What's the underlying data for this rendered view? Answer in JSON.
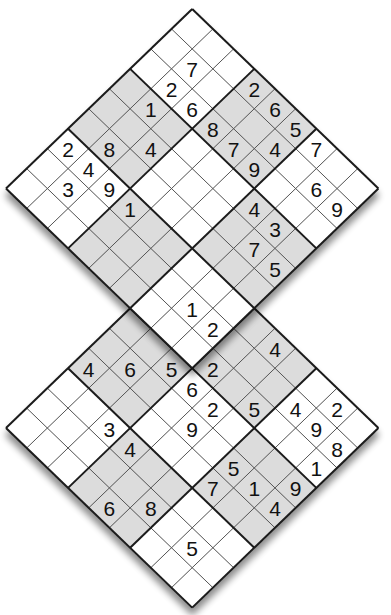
{
  "puzzle": {
    "type": "twin-diagonal-sudoku",
    "description": "Two overlapping 9x9 sudoku grids rotated 45 degrees, sharing one 3x3 box",
    "colors": {
      "shaded_box": "#dcdcdc",
      "white_box": "#ffffff",
      "thin_line": "#555555",
      "thick_line": "#1a1a1a",
      "digit": "#111111",
      "shadow": "#9a9a9a"
    },
    "grids": [
      {
        "id": "top-grid",
        "givens": [
          {
            "r": 0,
            "c": 3,
            "v": "2"
          },
          {
            "r": 0,
            "c": 4,
            "v": "6"
          },
          {
            "r": 0,
            "c": 5,
            "v": "5"
          },
          {
            "r": 0,
            "c": 6,
            "v": "7"
          },
          {
            "r": 1,
            "c": 1,
            "v": "7"
          },
          {
            "r": 1,
            "c": 5,
            "v": "4"
          },
          {
            "r": 1,
            "c": 7,
            "v": "6"
          },
          {
            "r": 1,
            "c": 8,
            "v": "9"
          },
          {
            "r": 2,
            "c": 1,
            "v": "2"
          },
          {
            "r": 2,
            "c": 2,
            "v": "6"
          },
          {
            "r": 2,
            "c": 3,
            "v": "8"
          },
          {
            "r": 2,
            "c": 4,
            "v": "7"
          },
          {
            "r": 2,
            "c": 5,
            "v": "9"
          },
          {
            "r": 3,
            "c": 1,
            "v": "1"
          },
          {
            "r": 3,
            "c": 6,
            "v": "4"
          },
          {
            "r": 3,
            "c": 7,
            "v": "3"
          },
          {
            "r": 4,
            "c": 2,
            "v": "4"
          },
          {
            "r": 4,
            "c": 7,
            "v": "7"
          },
          {
            "r": 4,
            "c": 8,
            "v": "5"
          },
          {
            "r": 5,
            "c": 1,
            "v": "8"
          },
          {
            "r": 6,
            "c": 0,
            "v": "2"
          },
          {
            "r": 6,
            "c": 1,
            "v": "4"
          },
          {
            "r": 6,
            "c": 2,
            "v": "9"
          },
          {
            "r": 6,
            "c": 3,
            "v": "1"
          },
          {
            "r": 7,
            "c": 1,
            "v": "3"
          },
          {
            "r": 7,
            "c": 7,
            "v": "1"
          },
          {
            "r": 7,
            "c": 8,
            "v": "2"
          }
        ]
      },
      {
        "id": "bottom-grid",
        "givens": [
          {
            "r": 0,
            "c": 4,
            "v": "4"
          },
          {
            "r": 0,
            "c": 7,
            "v": "2"
          },
          {
            "r": 1,
            "c": 6,
            "v": "4"
          },
          {
            "r": 1,
            "c": 7,
            "v": "9"
          },
          {
            "r": 1,
            "c": 8,
            "v": "8"
          },
          {
            "r": 2,
            "c": 3,
            "v": "2"
          },
          {
            "r": 2,
            "c": 5,
            "v": "5"
          },
          {
            "r": 2,
            "c": 8,
            "v": "1"
          },
          {
            "r": 3,
            "c": 2,
            "v": "5"
          },
          {
            "r": 3,
            "c": 3,
            "v": "6"
          },
          {
            "r": 3,
            "c": 4,
            "v": "2"
          },
          {
            "r": 3,
            "c": 8,
            "v": "9"
          },
          {
            "r": 4,
            "c": 1,
            "v": "6"
          },
          {
            "r": 4,
            "c": 4,
            "v": "9"
          },
          {
            "r": 4,
            "c": 6,
            "v": "5"
          },
          {
            "r": 4,
            "c": 7,
            "v": "1"
          },
          {
            "r": 4,
            "c": 8,
            "v": "4"
          },
          {
            "r": 5,
            "c": 0,
            "v": "4"
          },
          {
            "r": 5,
            "c": 6,
            "v": "7"
          },
          {
            "r": 6,
            "c": 2,
            "v": "3"
          },
          {
            "r": 6,
            "c": 3,
            "v": "4"
          },
          {
            "r": 7,
            "c": 5,
            "v": "8"
          },
          {
            "r": 7,
            "c": 7,
            "v": "5"
          },
          {
            "r": 8,
            "c": 4,
            "v": "6"
          }
        ]
      }
    ]
  }
}
